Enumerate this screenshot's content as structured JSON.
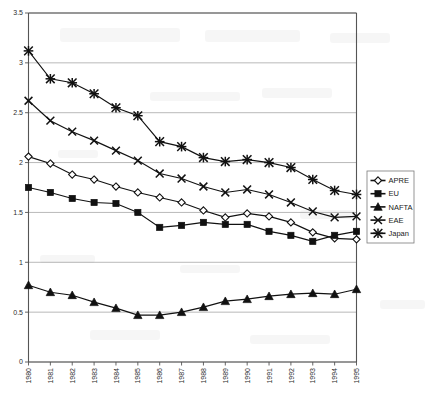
{
  "chart_data": {
    "type": "line",
    "title": "",
    "subtitle": "",
    "xlabel": "",
    "ylabel": "",
    "grid": true,
    "legend_position": "right",
    "xlim": [
      1980,
      1995
    ],
    "ylim": [
      0,
      3.5
    ],
    "ytick_values": [
      0,
      0.5,
      1,
      1.5,
      2,
      2.5,
      3,
      3.5
    ],
    "ytick_labels": [
      "0",
      "0.5",
      "1",
      "1.5",
      "2",
      "2.5",
      "3",
      "3.5"
    ],
    "categories": [
      "1980",
      "1981",
      "1982",
      "1983",
      "1984",
      "1985",
      "1986",
      "1987",
      "1988",
      "1989",
      "1990",
      "1991",
      "1992",
      "1993",
      "1994",
      "1995"
    ],
    "series": [
      {
        "name": "APRE",
        "marker": "open-diamond",
        "values": [
          2.06,
          1.99,
          1.88,
          1.83,
          1.76,
          1.7,
          1.65,
          1.6,
          1.52,
          1.45,
          1.49,
          1.46,
          1.4,
          1.3,
          1.24,
          1.23
        ]
      },
      {
        "name": "EU",
        "marker": "filled-square",
        "values": [
          1.75,
          1.7,
          1.64,
          1.6,
          1.59,
          1.5,
          1.35,
          1.37,
          1.4,
          1.38,
          1.38,
          1.31,
          1.27,
          1.21,
          1.27,
          1.31
        ]
      },
      {
        "name": "NAFTA",
        "marker": "filled-triangle",
        "values": [
          0.77,
          0.7,
          0.67,
          0.6,
          0.54,
          0.47,
          0.47,
          0.5,
          0.55,
          0.61,
          0.63,
          0.66,
          0.68,
          0.69,
          0.68,
          0.73
        ]
      },
      {
        "name": "EAE",
        "marker": "cross-x",
        "values": [
          2.62,
          2.42,
          2.31,
          2.22,
          2.12,
          2.02,
          1.89,
          1.84,
          1.76,
          1.7,
          1.73,
          1.68,
          1.6,
          1.51,
          1.45,
          1.46
        ]
      },
      {
        "name": "Japan",
        "marker": "star-asterisk",
        "values": [
          3.12,
          2.84,
          2.8,
          2.69,
          2.55,
          2.47,
          2.21,
          2.16,
          2.05,
          2.01,
          2.03,
          2.0,
          1.95,
          1.83,
          1.72,
          1.68
        ]
      }
    ]
  },
  "legend": {
    "items": [
      {
        "label": "APRE"
      },
      {
        "label": "EU"
      },
      {
        "label": "NAFTA"
      },
      {
        "label": "EAE"
      },
      {
        "label": "Japan"
      }
    ]
  }
}
